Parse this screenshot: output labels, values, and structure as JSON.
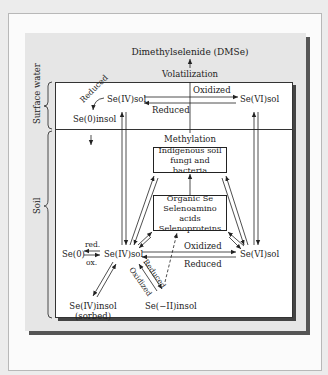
{
  "diagram": {
    "title": "Dimethylselenide (DMSe)",
    "volatilization_label": "Volatilization",
    "methylation_label": "Methylation",
    "zones": {
      "surface_water": "Surface water",
      "soil": "Soil"
    },
    "surface_water": {
      "se_iv_sol": "Se(IV)sol",
      "se_vi_sol": "Se(VI)sol",
      "se_0_insol": "Se(0)insol",
      "oxidized": "Oxidized",
      "reduced": "Reduced",
      "reduced_curved": "Reduced"
    },
    "microbes_box": {
      "line1": "Indigenous soil",
      "line2": "fungi and bacteria"
    },
    "organic_box": {
      "line1": "Organic Se",
      "line2": "Selenoamino acids",
      "line3": "Selenoproteins"
    },
    "soil": {
      "se_0": "Se(0)",
      "red": "red.",
      "ox": "ox.",
      "se_iv_sol": "Se(IV)sol",
      "se_vi_sol": "Se(VI)sol",
      "oxidized": "Oxidized",
      "reduced": "Reduced",
      "diag_reduced": "Reduced",
      "diag_oxidized": "Oxidized",
      "se_iv_insol": "Se(IV)insol",
      "sorbed": "(sorbed)",
      "se_minus_ii_insol": "Se(−II)insol"
    },
    "colors": {
      "page_bg": "#ececec",
      "panel_bg": "#e6e6e6",
      "shadow": "#555555",
      "ink": "#222222"
    }
  }
}
